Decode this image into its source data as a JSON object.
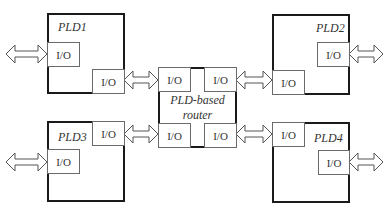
{
  "diagram": {
    "router": {
      "label_line1": "PLD-based",
      "label_line2": "router",
      "io_label": "I/O"
    },
    "plds": [
      {
        "name": "PLD1",
        "io_label": "I/O"
      },
      {
        "name": "PLD2",
        "io_label": "I/O"
      },
      {
        "name": "PLD3",
        "io_label": "I/O"
      },
      {
        "name": "PLD4",
        "io_label": "I/O"
      }
    ],
    "connector": "bidirectional-arrow-icon"
  }
}
